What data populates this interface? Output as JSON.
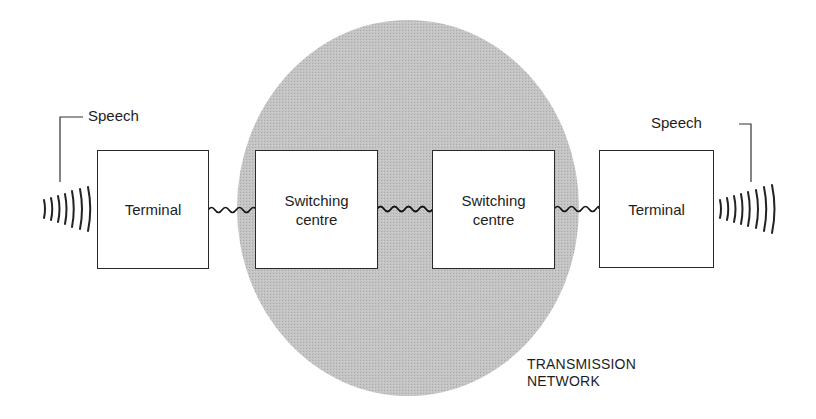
{
  "diagram": {
    "type": "telephone-network-block-diagram",
    "network": {
      "label_line1": "TRANSMISSION",
      "label_line2": "NETWORK",
      "fill_color": "#bdbdbd"
    },
    "left_speech": {
      "label": "Speech"
    },
    "right_speech": {
      "label": "Speech"
    },
    "nodes": [
      {
        "id": "terminal-left",
        "label": "Terminal"
      },
      {
        "id": "switch-left",
        "label_line1": "Switching",
        "label_line2": "centre"
      },
      {
        "id": "switch-right",
        "label_line1": "Switching",
        "label_line2": "centre"
      },
      {
        "id": "terminal-right",
        "label": "Terminal"
      }
    ],
    "links": [
      {
        "from": "terminal-left",
        "to": "switch-left",
        "style": "wavy"
      },
      {
        "from": "switch-left",
        "to": "switch-right",
        "style": "wavy"
      },
      {
        "from": "switch-right",
        "to": "terminal-right",
        "style": "wavy"
      }
    ]
  }
}
